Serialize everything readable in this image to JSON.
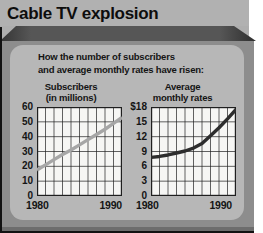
{
  "header": {
    "title": "Cable TV explosion"
  },
  "intro": {
    "line1": "How the number of subscribers",
    "line2": "and average monthly rates have risen:"
  },
  "palette": {
    "title_bar": "#b1b1b1",
    "ridge": "#565656",
    "frame": "#8d8d8d",
    "inner_panel": "#b7b7b7",
    "plot_bg": "#f6f6f4",
    "grid": "#1f1f1f",
    "text": "#141414",
    "subscribers_line": "#a6a6a6",
    "rates_line": "#2d2d2d"
  },
  "chart_data": [
    {
      "type": "line",
      "title_line1": "Subscribers",
      "title_line2": "(in millions)",
      "x": [
        1980,
        1981,
        1982,
        1983,
        1984,
        1985,
        1986,
        1987,
        1988,
        1989,
        1990
      ],
      "values": [
        17.5,
        21,
        24.5,
        28,
        31,
        34.5,
        38,
        41.5,
        45,
        49,
        53
      ],
      "ylim": [
        0,
        60
      ],
      "y_ticks": [
        "60",
        "50",
        "40",
        "30",
        "20",
        "10",
        "0"
      ],
      "y_divisions": 6,
      "x_divisions": 10,
      "x_tick_start": "1980",
      "x_tick_end": "1990",
      "grid": true,
      "legend": "none",
      "line_color": "#a6a6a6"
    },
    {
      "type": "line",
      "title_line1": "Average",
      "title_line2": "monthly rates",
      "x": [
        1980,
        1981,
        1982,
        1983,
        1984,
        1985,
        1986,
        1987,
        1988,
        1989,
        1990
      ],
      "values": [
        7.8,
        8.0,
        8.3,
        8.7,
        9.1,
        9.7,
        10.6,
        12.2,
        13.8,
        15.6,
        17.5
      ],
      "ylim": [
        0,
        18
      ],
      "y_ticks": [
        "$18",
        "15",
        "12",
        "9",
        "6",
        "3",
        "0"
      ],
      "y_divisions": 6,
      "x_divisions": 10,
      "x_tick_start": "1980",
      "x_tick_end": "1990",
      "grid": true,
      "legend": "none",
      "line_color": "#2d2d2d"
    }
  ]
}
